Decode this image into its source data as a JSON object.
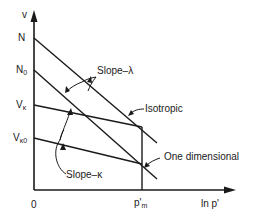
{
  "axes": {
    "y_label": "v",
    "x_label": "ln p'",
    "origin_label": "0"
  },
  "y_ticks": {
    "N": "N",
    "N0_main": "N",
    "N0_sub": "0",
    "Vk_main": "V",
    "Vk_sub": "κ",
    "Vk0_main": "V",
    "Vk0_sub": "κ0"
  },
  "x_ticks": {
    "pm_main": "p'",
    "pm_sub": "m"
  },
  "annotations": {
    "slope_lambda": "Slope–λ",
    "slope_kappa": "Slope–κ",
    "isotropic": "Isotropic",
    "one_dimensional": "One dimensional"
  },
  "colors": {
    "line": "#1a1a1a",
    "background": "#ffffff"
  }
}
